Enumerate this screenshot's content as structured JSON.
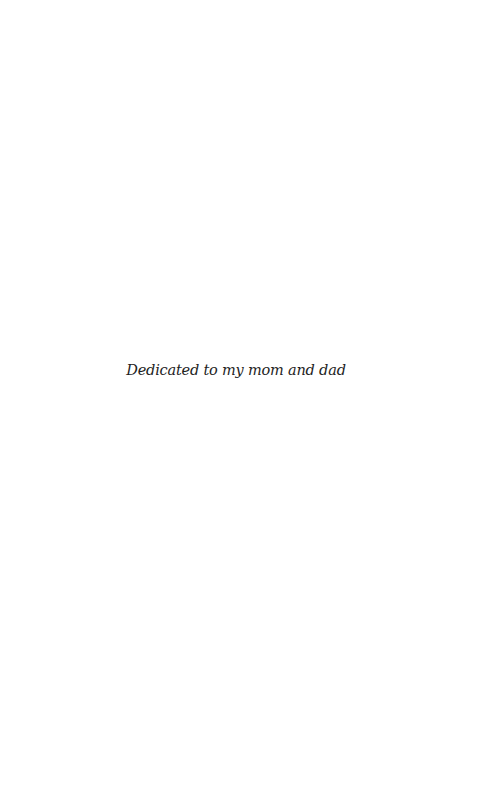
{
  "page": {
    "type": "dedication",
    "dedication_text": "Dedicated to my mom and dad"
  },
  "colors": {
    "background": "#ffffff",
    "text": "#1e1e1e"
  }
}
